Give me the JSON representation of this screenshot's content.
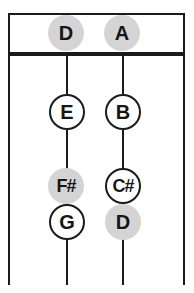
{
  "chart": {
    "type": "string-fingering-diagram",
    "strings": [
      {
        "name": "D string",
        "open_note": {
          "label": "D",
          "highlighted": true
        },
        "stops": [
          {
            "label": "E",
            "highlighted": false
          },
          {
            "label": "F#",
            "highlighted": true
          },
          {
            "label": "G",
            "highlighted": false
          }
        ]
      },
      {
        "name": "A string",
        "open_note": {
          "label": "A",
          "highlighted": true
        },
        "stops": [
          {
            "label": "B",
            "highlighted": false
          },
          {
            "label": "C#",
            "highlighted": false
          },
          {
            "label": "D",
            "highlighted": true
          }
        ]
      }
    ]
  },
  "colors": {
    "background": "#ffffff",
    "line": "#1b1b1b",
    "highlight_fill": "#d4d4d4",
    "note_fill": "#ffffff",
    "text": "#161616"
  }
}
